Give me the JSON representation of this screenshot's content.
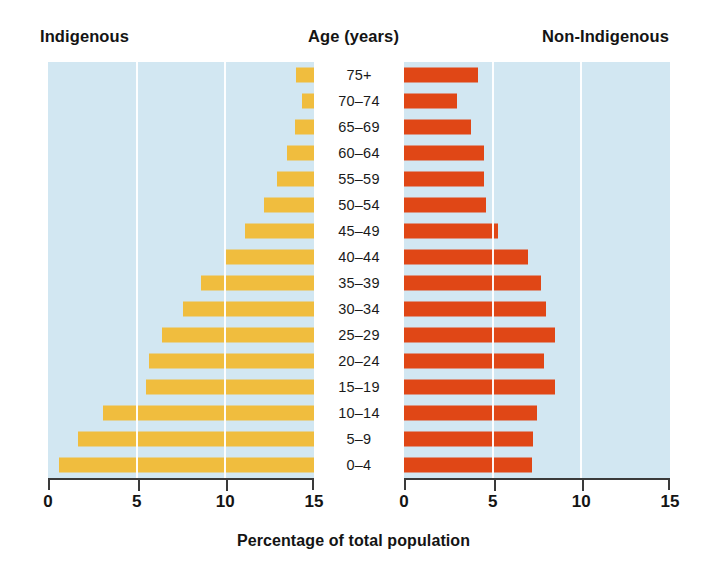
{
  "headers": {
    "left": "Indigenous",
    "center": "Age (years)",
    "right": "Non-Indigenous"
  },
  "axis_title": "Percentage of total population",
  "colors": {
    "indigenous_bar": "#F0BD3E",
    "non_indigenous_bar": "#E04716",
    "panel_background": "#D2E7F2",
    "gridline": "#FFFFFF",
    "axis": "#3A3A3A",
    "text": "#141414"
  },
  "chart_data": {
    "type": "bar",
    "title": "Age (years)",
    "subtitle": "",
    "xlabel": "Percentage of total population",
    "ylabel": "Age (years)",
    "orientation": "horizontal",
    "layout": "population-pyramid",
    "grid": true,
    "legend_position": "top",
    "xlim": [
      0,
      15
    ],
    "xticks": [
      0,
      5,
      10,
      15
    ],
    "left_axis_ticklabels": [
      "15",
      "10",
      "5",
      "0"
    ],
    "right_axis_ticklabels": [
      "0",
      "5",
      "10",
      "15"
    ],
    "categories": [
      "75+",
      "70–74",
      "65–69",
      "60–64",
      "55–59",
      "50–54",
      "45–49",
      "40–44",
      "35–39",
      "30–34",
      "25–29",
      "20–24",
      "15–19",
      "10–14",
      "5–9",
      "0–4"
    ],
    "series": [
      {
        "name": "Indigenous",
        "side": "left",
        "color": "#F0BD3E",
        "values": [
          1.0,
          0.7,
          1.1,
          1.5,
          2.1,
          2.8,
          3.9,
          5.0,
          6.4,
          7.4,
          8.6,
          9.3,
          9.5,
          11.9,
          13.3,
          14.4
        ]
      },
      {
        "name": "Non-Indigenous",
        "side": "right",
        "color": "#E04716",
        "values": [
          4.2,
          3.0,
          3.8,
          4.5,
          4.5,
          4.6,
          5.3,
          7.0,
          7.7,
          8.0,
          8.5,
          7.9,
          8.5,
          7.5,
          7.3,
          7.2
        ]
      }
    ]
  }
}
